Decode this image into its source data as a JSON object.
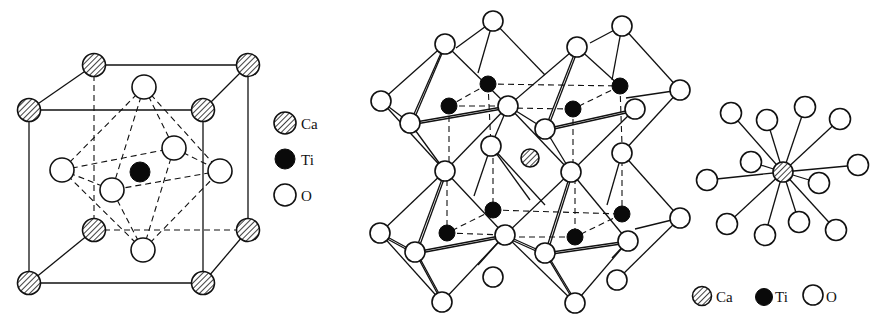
{
  "figure": {
    "panels": [
      {
        "id": "unit-cell",
        "title": "Perovskite unit cell (cube with TiO6 octahedron)"
      },
      {
        "id": "octahedra-network",
        "title": "Corner-sharing TiO6 octahedra with Ca in cavity"
      },
      {
        "id": "ca-coordination",
        "title": "12-fold oxygen coordination of Ca"
      }
    ],
    "legend_left": {
      "items": [
        {
          "symbol": "hatched-circle",
          "label": "Ca"
        },
        {
          "symbol": "filled-circle",
          "label": "Ti"
        },
        {
          "symbol": "open-circle",
          "label": "O"
        }
      ]
    },
    "legend_right": {
      "items": [
        {
          "symbol": "hatched-circle",
          "label": "Ca"
        },
        {
          "symbol": "filled-circle",
          "label": "Ti"
        },
        {
          "symbol": "open-circle",
          "label": "O"
        }
      ]
    },
    "colors": {
      "line": "#111111",
      "ti_fill": "#0a0a0a",
      "o_fill": "#ffffff",
      "background": "#ffffff"
    }
  }
}
